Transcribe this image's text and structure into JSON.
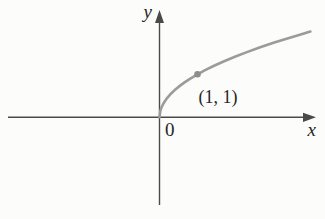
{
  "figure": {
    "labels": {
      "y_axis": "y",
      "x_axis": "x",
      "origin": "0",
      "point": "(1, 1)"
    },
    "colors": {
      "background": "#fcfcfa",
      "axis": "#4a4a4a",
      "curve": "#9b9b9b",
      "point": "#8d8d8d",
      "text": "#262626"
    }
  },
  "chart_data": {
    "type": "line",
    "title": "",
    "xlabel": "x",
    "ylabel": "y",
    "xlim": [
      -3.97,
      4.1
    ],
    "ylim": [
      -2.05,
      2.49
    ],
    "grid": false,
    "legend": false,
    "series": [
      {
        "name": "curve",
        "x": [
          0,
          0.02,
          0.05,
          0.1,
          0.15,
          0.2,
          0.3,
          0.4,
          0.5,
          0.65,
          0.8,
          1.0,
          1.2,
          1.45,
          1.7,
          2.0,
          2.3,
          2.65,
          3.0,
          3.3,
          3.65,
          3.97
        ],
        "y": [
          0,
          0.141,
          0.224,
          0.316,
          0.387,
          0.447,
          0.548,
          0.632,
          0.707,
          0.806,
          0.894,
          1.0,
          1.095,
          1.204,
          1.304,
          1.414,
          1.517,
          1.628,
          1.732,
          1.817,
          1.91,
          1.992
        ]
      }
    ],
    "marked_points": [
      {
        "x": 1,
        "y": 1,
        "label": "(1, 1)"
      }
    ]
  }
}
